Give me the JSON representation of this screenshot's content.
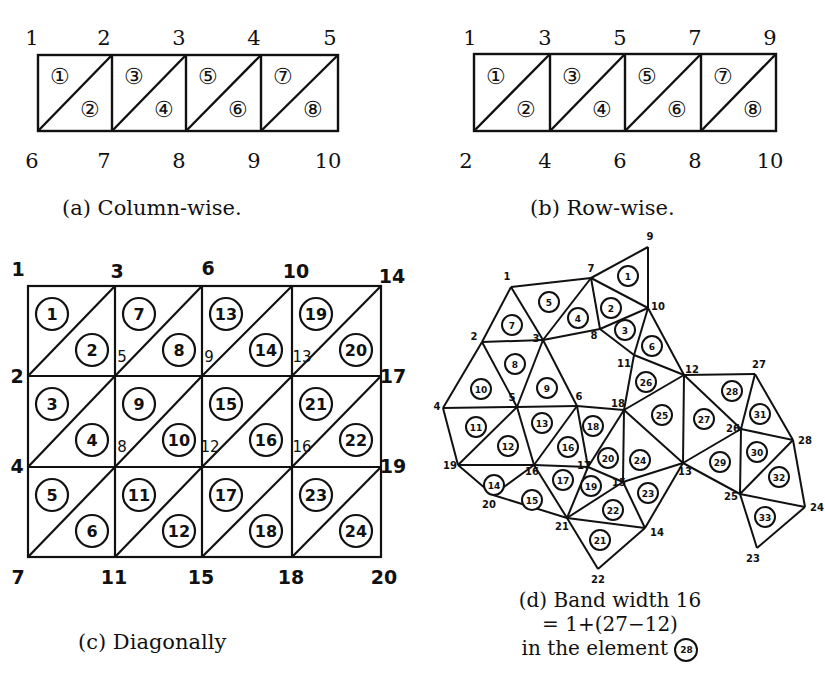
{
  "figures": {
    "a": {
      "caption": "(a)  Column-wise.",
      "top_nodes": [
        "1",
        "2",
        "3",
        "4",
        "5"
      ],
      "bottom_nodes": [
        "6",
        "7",
        "8",
        "9",
        "10"
      ],
      "elements": [
        "①",
        "②",
        "③",
        "④",
        "⑤",
        "⑥",
        "⑦",
        "⑧"
      ]
    },
    "b": {
      "caption": "(b)  Row-wise.",
      "top_nodes": [
        "1",
        "3",
        "5",
        "7",
        "9"
      ],
      "bottom_nodes": [
        "2",
        "4",
        "6",
        "8",
        "10"
      ],
      "elements": [
        "①",
        "②",
        "③",
        "④",
        "⑤",
        "⑥",
        "⑦",
        "⑧"
      ]
    },
    "c": {
      "caption": "(c)  Diagonally",
      "row0_nodes": [
        "1",
        "3",
        "6",
        "10",
        "14"
      ],
      "row1_nodes": [
        "2",
        "5",
        "9",
        "13",
        "17"
      ],
      "row2_nodes": [
        "4",
        "8",
        "12",
        "16",
        "19"
      ],
      "row3_nodes": [
        "7",
        "11",
        "15",
        "18",
        "20"
      ],
      "elements_upper": [
        [
          "1",
          "7",
          "13",
          "19"
        ],
        [
          "3",
          "9",
          "15",
          "21"
        ],
        [
          "5",
          "11",
          "17",
          "23"
        ]
      ],
      "elements_lower": [
        [
          "2",
          "8",
          "14",
          "20"
        ],
        [
          "4",
          "10",
          "16",
          "22"
        ],
        [
          "6",
          "12",
          "18",
          "24"
        ]
      ]
    },
    "d": {
      "caption_line1": "(d)  Band width 16",
      "caption_line2": "= 1+(27−12)",
      "caption_line3": "in the element",
      "caption_badge": "28",
      "nodes": [
        {
          "id": "1",
          "x": 511,
          "y": 287
        },
        {
          "id": "2",
          "x": 482,
          "y": 342
        },
        {
          "id": "3",
          "x": 543,
          "y": 340
        },
        {
          "id": "4",
          "x": 443,
          "y": 408
        },
        {
          "id": "5",
          "x": 517,
          "y": 407
        },
        {
          "id": "6",
          "x": 577,
          "y": 406
        },
        {
          "id": "7",
          "x": 591,
          "y": 278
        },
        {
          "id": "8",
          "x": 600,
          "y": 329
        },
        {
          "id": "9",
          "x": 648,
          "y": 247
        },
        {
          "id": "10",
          "x": 648,
          "y": 308
        },
        {
          "id": "11",
          "x": 634,
          "y": 355
        },
        {
          "id": "12",
          "x": 684,
          "y": 375
        },
        {
          "id": "13",
          "x": 683,
          "y": 463
        },
        {
          "id": "14",
          "x": 645,
          "y": 528
        },
        {
          "id": "15",
          "x": 623,
          "y": 482
        },
        {
          "id": "16",
          "x": 534,
          "y": 465
        },
        {
          "id": "17",
          "x": 588,
          "y": 467
        },
        {
          "id": "18",
          "x": 624,
          "y": 410
        },
        {
          "id": "19",
          "x": 458,
          "y": 465
        },
        {
          "id": "20",
          "x": 493,
          "y": 495
        },
        {
          "id": "21",
          "x": 567,
          "y": 518
        },
        {
          "id": "22",
          "x": 598,
          "y": 569
        },
        {
          "id": "23",
          "x": 757,
          "y": 548
        },
        {
          "id": "24",
          "x": 805,
          "y": 507
        },
        {
          "id": "25",
          "x": 740,
          "y": 494
        },
        {
          "id": "26",
          "x": 741,
          "y": 429
        },
        {
          "id": "27",
          "x": 755,
          "y": 374
        },
        {
          "id": "28",
          "x": 793,
          "y": 440
        }
      ],
      "elements": [
        {
          "id": "1",
          "x": 628,
          "y": 276
        },
        {
          "id": "2",
          "x": 611,
          "y": 308
        },
        {
          "id": "3",
          "x": 625,
          "y": 330
        },
        {
          "id": "4",
          "x": 578,
          "y": 318
        },
        {
          "id": "5",
          "x": 549,
          "y": 302
        },
        {
          "id": "6",
          "x": 652,
          "y": 346
        },
        {
          "id": "7",
          "x": 512,
          "y": 325
        },
        {
          "id": "8",
          "x": 515,
          "y": 364
        },
        {
          "id": "9",
          "x": 547,
          "y": 388
        },
        {
          "id": "10",
          "x": 481,
          "y": 389
        },
        {
          "id": "11",
          "x": 476,
          "y": 427
        },
        {
          "id": "12",
          "x": 508,
          "y": 446
        },
        {
          "id": "13",
          "x": 542,
          "y": 423
        },
        {
          "id": "14",
          "x": 494,
          "y": 485
        },
        {
          "id": "15",
          "x": 532,
          "y": 500
        },
        {
          "id": "16",
          "x": 568,
          "y": 447
        },
        {
          "id": "17",
          "x": 563,
          "y": 480
        },
        {
          "id": "18",
          "x": 593,
          "y": 426
        },
        {
          "id": "19",
          "x": 591,
          "y": 486
        },
        {
          "id": "20",
          "x": 608,
          "y": 458
        },
        {
          "id": "21",
          "x": 600,
          "y": 540
        },
        {
          "id": "22",
          "x": 613,
          "y": 510
        },
        {
          "id": "23",
          "x": 648,
          "y": 493
        },
        {
          "id": "24",
          "x": 640,
          "y": 460
        },
        {
          "id": "25",
          "x": 662,
          "y": 415
        },
        {
          "id": "26",
          "x": 646,
          "y": 382
        },
        {
          "id": "27",
          "x": 704,
          "y": 419
        },
        {
          "id": "28",
          "x": 732,
          "y": 391
        },
        {
          "id": "29",
          "x": 720,
          "y": 462
        },
        {
          "id": "30",
          "x": 757,
          "y": 452
        },
        {
          "id": "31",
          "x": 760,
          "y": 414
        },
        {
          "id": "32",
          "x": 779,
          "y": 477
        },
        {
          "id": "33",
          "x": 765,
          "y": 517
        }
      ]
    }
  }
}
